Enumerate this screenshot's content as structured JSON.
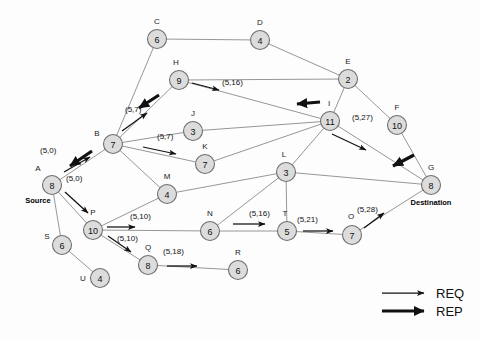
{
  "diagram": {
    "node_fill": "#dcdcdc",
    "node_stroke": "#6e6e6e",
    "edge_color": "#8a8a8a",
    "arrow_color": "#111111",
    "nodes": [
      {
        "id": "A",
        "label": "A",
        "value": "8",
        "x": 52,
        "y": 185,
        "name_dx": -14,
        "name_dy": -14,
        "role": "Source",
        "role_dx": -14,
        "role_dy": 18
      },
      {
        "id": "B",
        "label": "B",
        "value": "7",
        "x": 113,
        "y": 144,
        "name_dx": -16,
        "name_dy": -8,
        "role": "",
        "role_dx": 0,
        "role_dy": 0
      },
      {
        "id": "C",
        "label": "C",
        "value": "6",
        "x": 157,
        "y": 39,
        "name_dx": 0,
        "name_dy": -15,
        "role": "",
        "role_dx": 0,
        "role_dy": 0
      },
      {
        "id": "D",
        "label": "D",
        "value": "4",
        "x": 260,
        "y": 40,
        "name_dx": 0,
        "name_dy": -15,
        "role": "",
        "role_dx": 0,
        "role_dy": 0
      },
      {
        "id": "E",
        "label": "E",
        "value": "2",
        "x": 348,
        "y": 79,
        "name_dx": 0,
        "name_dy": -15,
        "role": "",
        "role_dx": 0,
        "role_dy": 0
      },
      {
        "id": "F",
        "label": "F",
        "value": "10",
        "x": 397,
        "y": 125,
        "name_dx": 0,
        "name_dy": -15,
        "role": "",
        "role_dx": 0,
        "role_dy": 0
      },
      {
        "id": "G",
        "label": "G",
        "value": "8",
        "x": 431,
        "y": 185,
        "name_dx": 0,
        "name_dy": -15,
        "role": "Destination",
        "role_dx": 0,
        "role_dy": 20
      },
      {
        "id": "H",
        "label": "H",
        "value": "9",
        "x": 179,
        "y": 80,
        "name_dx": -3,
        "name_dy": -15,
        "role": "",
        "role_dx": 0,
        "role_dy": 0
      },
      {
        "id": "I",
        "label": "I",
        "value": "11",
        "x": 330,
        "y": 121,
        "name_dx": -1,
        "name_dy": -15,
        "role": "",
        "role_dx": 0,
        "role_dy": 0
      },
      {
        "id": "J",
        "label": "J",
        "value": "3",
        "x": 193,
        "y": 131,
        "name_dx": 0,
        "name_dy": -15,
        "role": "",
        "role_dx": 0,
        "role_dy": 0
      },
      {
        "id": "K",
        "label": "K",
        "value": "7",
        "x": 205,
        "y": 164,
        "name_dx": 0,
        "name_dy": -15,
        "role": "",
        "role_dx": 0,
        "role_dy": 0
      },
      {
        "id": "L",
        "label": "L",
        "value": "3",
        "x": 286,
        "y": 172,
        "name_dx": -2,
        "name_dy": -15,
        "role": "",
        "role_dx": 0,
        "role_dy": 0
      },
      {
        "id": "M",
        "label": "M",
        "value": "4",
        "x": 167,
        "y": 194,
        "name_dx": 0,
        "name_dy": -15,
        "role": "",
        "role_dx": 0,
        "role_dy": 0
      },
      {
        "id": "N",
        "label": "N",
        "value": "6",
        "x": 210,
        "y": 231,
        "name_dx": 0,
        "name_dy": -15,
        "role": "",
        "role_dx": 0,
        "role_dy": 0
      },
      {
        "id": "O",
        "label": "O",
        "value": "7",
        "x": 352,
        "y": 235,
        "name_dx": -1,
        "name_dy": -16,
        "role": "",
        "role_dx": 0,
        "role_dy": 0
      },
      {
        "id": "P",
        "label": "P",
        "value": "10",
        "x": 93,
        "y": 230,
        "name_dx": 0,
        "name_dy": -15,
        "role": "",
        "role_dx": 0,
        "role_dy": 0
      },
      {
        "id": "Q",
        "label": "Q",
        "value": "8",
        "x": 148,
        "y": 265,
        "name_dx": 0,
        "name_dy": -15,
        "role": "",
        "role_dx": 0,
        "role_dy": 0
      },
      {
        "id": "R",
        "label": "R",
        "value": "6",
        "x": 238,
        "y": 270,
        "name_dx": 0,
        "name_dy": -15,
        "role": "",
        "role_dx": 0,
        "role_dy": 0
      },
      {
        "id": "S",
        "label": "S",
        "value": "6",
        "x": 62,
        "y": 245,
        "name_dx": -15,
        "name_dy": -6,
        "role": "",
        "role_dx": 0,
        "role_dy": 0
      },
      {
        "id": "T",
        "label": "T",
        "value": "5",
        "x": 287,
        "y": 231,
        "name_dx": -2,
        "name_dy": -15,
        "role": "",
        "role_dx": 0,
        "role_dy": 0
      },
      {
        "id": "U",
        "label": "U",
        "value": "4",
        "x": 100,
        "y": 278,
        "name_dx": -17,
        "name_dy": 3,
        "role": "",
        "role_dx": 0,
        "role_dy": 0
      }
    ],
    "edges": [
      {
        "from": "A",
        "to": "B"
      },
      {
        "from": "A",
        "to": "P"
      },
      {
        "from": "A",
        "to": "S"
      },
      {
        "from": "B",
        "to": "C"
      },
      {
        "from": "B",
        "to": "H"
      },
      {
        "from": "B",
        "to": "J"
      },
      {
        "from": "B",
        "to": "K"
      },
      {
        "from": "B",
        "to": "M"
      },
      {
        "from": "C",
        "to": "D"
      },
      {
        "from": "D",
        "to": "E"
      },
      {
        "from": "E",
        "to": "H"
      },
      {
        "from": "E",
        "to": "I"
      },
      {
        "from": "E",
        "to": "F"
      },
      {
        "from": "F",
        "to": "G"
      },
      {
        "from": "H",
        "to": "I"
      },
      {
        "from": "J",
        "to": "I"
      },
      {
        "from": "K",
        "to": "I"
      },
      {
        "from": "I",
        "to": "L"
      },
      {
        "from": "I",
        "to": "G"
      },
      {
        "from": "L",
        "to": "M"
      },
      {
        "from": "L",
        "to": "N"
      },
      {
        "from": "L",
        "to": "T"
      },
      {
        "from": "L",
        "to": "G"
      },
      {
        "from": "M",
        "to": "P"
      },
      {
        "from": "P",
        "to": "N"
      },
      {
        "from": "P",
        "to": "Q"
      },
      {
        "from": "N",
        "to": "T"
      },
      {
        "from": "T",
        "to": "O"
      },
      {
        "from": "O",
        "to": "G"
      },
      {
        "from": "Q",
        "to": "R"
      },
      {
        "from": "S",
        "to": "U"
      }
    ],
    "packets": [
      {
        "id": "req-a-b",
        "type": "REQ",
        "text": "(5,0)",
        "tx": 40,
        "ty": 153,
        "x1": 64,
        "y1": 172,
        "x2": 90,
        "y2": 157
      },
      {
        "id": "req-a-p",
        "type": "REQ",
        "text": "(5,0)",
        "tx": 66,
        "ty": 181,
        "x1": 65,
        "y1": 192,
        "x2": 88,
        "y2": 213
      },
      {
        "id": "req-b-h",
        "type": "REQ",
        "text": "(5,7)",
        "tx": 125,
        "ty": 112,
        "x1": 122,
        "y1": 131,
        "x2": 147,
        "y2": 113
      },
      {
        "id": "req-b-k",
        "type": "REQ",
        "text": "(5,7)",
        "tx": 157,
        "ty": 139,
        "x1": 143,
        "y1": 147,
        "x2": 176,
        "y2": 154
      },
      {
        "id": "req-h-i",
        "type": "REQ",
        "text": "(5,16)",
        "tx": 222,
        "ty": 85,
        "x1": 192,
        "y1": 83,
        "x2": 219,
        "y2": 90
      },
      {
        "id": "req-i-g",
        "type": "REQ",
        "text": "(5,27)",
        "tx": 352,
        "ty": 120,
        "x1": 332,
        "y1": 134,
        "x2": 366,
        "y2": 150
      },
      {
        "id": "req-n-t",
        "type": "REQ",
        "text": "(5,16)",
        "tx": 249,
        "ty": 216,
        "x1": 233,
        "y1": 224,
        "x2": 265,
        "y2": 224
      },
      {
        "id": "req-t-o",
        "type": "REQ",
        "text": "(5,21)",
        "tx": 297,
        "ty": 222,
        "x1": 303,
        "y1": 231,
        "x2": 333,
        "y2": 231
      },
      {
        "id": "req-o-g",
        "type": "REQ",
        "text": "(5,28)",
        "tx": 357,
        "ty": 212,
        "x1": 364,
        "y1": 228,
        "x2": 384,
        "y2": 213
      },
      {
        "id": "req-p-n",
        "type": "REQ",
        "text": "(5,10)",
        "tx": 130,
        "ty": 219,
        "x1": 107,
        "y1": 227,
        "x2": 135,
        "y2": 227
      },
      {
        "id": "req-p-q",
        "type": "REQ",
        "text": "(5,10)",
        "tx": 117,
        "ty": 241,
        "x1": 108,
        "y1": 236,
        "x2": 131,
        "y2": 252
      },
      {
        "id": "req-q-r",
        "type": "REQ",
        "text": "(5,18)",
        "tx": 163,
        "ty": 254,
        "x1": 167,
        "y1": 266,
        "x2": 197,
        "y2": 266
      },
      {
        "id": "rep-b-a",
        "type": "REP",
        "text": "",
        "tx": 0,
        "ty": 0,
        "x1": 92,
        "y1": 151,
        "x2": 70,
        "y2": 166
      },
      {
        "id": "rep-h-b",
        "type": "REP",
        "text": "",
        "tx": 0,
        "ty": 0,
        "x1": 159,
        "y1": 95,
        "x2": 139,
        "y2": 108
      },
      {
        "id": "rep-i-h",
        "type": "REP",
        "text": "",
        "tx": 0,
        "ty": 0,
        "x1": 320,
        "y1": 102,
        "x2": 297,
        "y2": 104
      },
      {
        "id": "rep-g-i",
        "type": "REP",
        "text": "",
        "tx": 0,
        "ty": 0,
        "x1": 414,
        "y1": 155,
        "x2": 393,
        "y2": 166
      }
    ],
    "legend": [
      {
        "id": "legend-req",
        "type": "REQ",
        "label": "REQ",
        "x1": 382,
        "y1": 293,
        "x2": 424,
        "y2": 293,
        "text_x": 436,
        "text_y": 298
      },
      {
        "id": "legend-rep",
        "type": "REP",
        "label": "REP",
        "x1": 382,
        "y1": 311,
        "x2": 424,
        "y2": 311,
        "text_x": 436,
        "text_y": 316
      }
    ]
  }
}
